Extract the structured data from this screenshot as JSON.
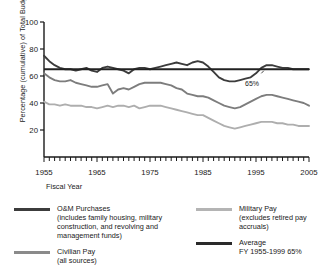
{
  "chart_data": {
    "type": "line",
    "title": "",
    "xlabel": "Fiscal Year",
    "ylabel": "Percentage (cumulative) of Total Budget",
    "xlim": [
      1955,
      2005
    ],
    "ylim": [
      0,
      100
    ],
    "ytick_labels": [
      "20",
      "40",
      "60",
      "80",
      "100"
    ],
    "yticks": [
      20,
      40,
      60,
      80,
      100
    ],
    "xtick_labels": [
      "1955",
      "1965",
      "1975",
      "1985",
      "1995",
      "2005"
    ],
    "xticks": [
      1955,
      1965,
      1975,
      1985,
      1995,
      2005
    ],
    "minor_xtick_interval": 1,
    "grid": false,
    "legend_position": "below",
    "annotations": [
      {
        "text": "65%",
        "x": 1996,
        "y": 59,
        "points_to_y": 65
      }
    ],
    "x": [
      1955,
      1956,
      1957,
      1958,
      1959,
      1960,
      1961,
      1962,
      1963,
      1964,
      1965,
      1966,
      1967,
      1968,
      1969,
      1970,
      1971,
      1972,
      1973,
      1974,
      1975,
      1976,
      1977,
      1978,
      1979,
      1980,
      1981,
      1982,
      1983,
      1984,
      1985,
      1986,
      1987,
      1988,
      1989,
      1990,
      1991,
      1992,
      1993,
      1994,
      1995,
      1996,
      1997,
      1998,
      1999,
      2000,
      2001,
      2002,
      2003,
      2004,
      2005
    ],
    "series": [
      {
        "name": "O&M Purchases",
        "color": "#3c3c3c",
        "values": [
          75,
          71,
          68,
          66,
          65,
          65,
          64,
          65,
          66,
          64,
          63,
          66,
          67,
          66,
          65,
          64,
          62,
          65,
          66,
          66,
          65,
          66,
          67,
          68,
          69,
          70,
          69,
          68,
          70,
          71,
          70,
          67,
          63,
          59,
          57,
          56,
          56,
          57,
          58,
          59,
          62,
          66,
          68,
          68,
          67,
          66,
          66,
          65,
          65,
          65,
          65
        ]
      },
      {
        "name": "Civilian Pay",
        "color": "#7d7d7d",
        "values": [
          62,
          59,
          57,
          56,
          56,
          57,
          55,
          54,
          53,
          52,
          52,
          53,
          54,
          47,
          50,
          51,
          50,
          52,
          54,
          55,
          55,
          55,
          55,
          54,
          53,
          51,
          50,
          47,
          46,
          45,
          45,
          44,
          42,
          40,
          38,
          37,
          36,
          37,
          39,
          41,
          43,
          45,
          46,
          46,
          45,
          44,
          43,
          42,
          41,
          40,
          38
        ]
      },
      {
        "name": "Military Pay",
        "color": "#aeaeae",
        "values": [
          41,
          39,
          39,
          38,
          39,
          38,
          38,
          38,
          37,
          37,
          36,
          37,
          38,
          37,
          38,
          38,
          37,
          38,
          36,
          37,
          38,
          38,
          38,
          37,
          36,
          35,
          34,
          33,
          32,
          31,
          31,
          29,
          27,
          25,
          23,
          22,
          21,
          22,
          23,
          24,
          25,
          26,
          26,
          26,
          25,
          25,
          24,
          24,
          23,
          23,
          23
        ]
      },
      {
        "name": "Average FY 1955-1999",
        "color": "#222222",
        "type": "reference-line",
        "constant_value": 65
      }
    ]
  },
  "axis": {
    "ylabel": "Percentage (cumulative) of Total Budget",
    "xlabel": "Fiscal Year",
    "yticks": [
      "100",
      "80",
      "60",
      "40",
      "20"
    ],
    "xticks": [
      "1955",
      "1965",
      "1975",
      "1985",
      "1995",
      "2005"
    ]
  },
  "annotation": {
    "average_callout": "65%"
  },
  "legend": {
    "entries": [
      {
        "name": "om-purchases",
        "color": "#3c3c3c",
        "title": "O&M Purchases",
        "sub": "(includes family housing, military construction, and revolving and management funds)"
      },
      {
        "name": "civilian-pay",
        "color": "#8a8a8a",
        "title": "Civilian Pay",
        "sub": "(all sources)"
      },
      {
        "name": "military-pay",
        "color": "#b4b4b4",
        "title": "Military Pay",
        "sub": "(excludes retired pay accruals)"
      },
      {
        "name": "average",
        "color": "#2a2a2a",
        "title": "Average",
        "sub": "FY 1955-1999 65%"
      }
    ]
  }
}
